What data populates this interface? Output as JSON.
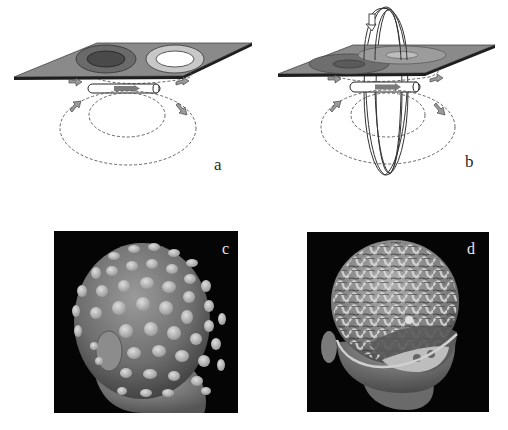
{
  "figure": {
    "panels": [
      {
        "id": "a",
        "label": "a",
        "description": "Magnetic dipole source under sensor plane, field loops and flux pattern (dark and light rings)"
      },
      {
        "id": "b",
        "label": "b",
        "description": "Same dipole with rotating vertical loop indicating orientation change; weaker flux pattern on plane"
      },
      {
        "id": "c",
        "label": "c",
        "description": "3D rendered head with EEG electrode array on scalp"
      },
      {
        "id": "d",
        "label": "d",
        "description": "3D rendered head with skull opened showing cortical surface of brain"
      }
    ]
  },
  "colors": {
    "background": "#ffffff",
    "plate_fill": "#8a8a8a",
    "plate_edge": "#1e1e1e",
    "ring_dark_outer": "#6a6a6a",
    "ring_dark_inner": "#4a4a4a",
    "ring_light_outer": "#c8c8c8",
    "ring_light_inner": "#ffffff",
    "photo_background": "#050505",
    "dashed_line": "#555555",
    "arrow_fill": "#9a9a9a"
  }
}
